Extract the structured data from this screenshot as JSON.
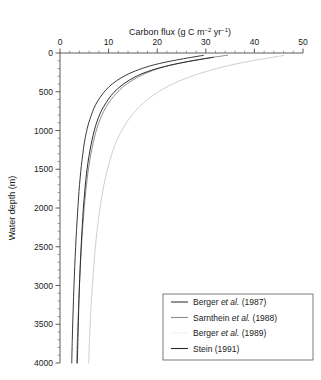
{
  "chart_data": {
    "type": "line",
    "title": "Carbon flux (g C m−2 yr−1)",
    "title_parts": {
      "prefix": "Carbon flux (g C m",
      "sup1": "−2",
      "mid": " yr",
      "sup2": "−1",
      "suffix": ")"
    },
    "xlabel": "Carbon flux (g C m-2 yr-1)",
    "ylabel": "Water depth (m)",
    "xlim": [
      0,
      50
    ],
    "ylim": [
      0,
      4000
    ],
    "y_inverted": true,
    "grid": false,
    "x_axis_position": "top",
    "xticks": [
      0,
      10,
      20,
      30,
      40,
      50
    ],
    "xtick_labels": [
      "0",
      "10",
      "20",
      "30",
      "40",
      "50"
    ],
    "x_minor_interval": 2,
    "yticks": [
      0,
      500,
      1000,
      1500,
      2000,
      2500,
      3000,
      3500,
      4000
    ],
    "ytick_labels": [
      "0",
      "500",
      "1000",
      "1500",
      "2000",
      "2500",
      "3000",
      "3500",
      "4000"
    ],
    "y_minor_interval": 100,
    "legend_position": "bottom-right",
    "series": [
      {
        "name": "Berger et al. (1987)",
        "name_prefix": "Berger ",
        "name_italic": "et al.",
        "name_suffix": " (1987)",
        "color": "#3a3a3a",
        "width": 1.0,
        "points": [
          [
            29.5,
            30
          ],
          [
            24.0,
            90
          ],
          [
            19.5,
            150
          ],
          [
            16.2,
            215
          ],
          [
            13.6,
            285
          ],
          [
            11.6,
            360
          ],
          [
            10.0,
            440
          ],
          [
            8.8,
            525
          ],
          [
            7.8,
            615
          ],
          [
            7.0,
            710
          ],
          [
            6.4,
            810
          ],
          [
            5.85,
            915
          ],
          [
            5.4,
            1030
          ],
          [
            5.0,
            1160
          ],
          [
            4.7,
            1300
          ],
          [
            4.4,
            1450
          ],
          [
            4.15,
            1610
          ],
          [
            3.9,
            1790
          ],
          [
            3.7,
            1980
          ],
          [
            3.5,
            2180
          ],
          [
            3.3,
            2400
          ],
          [
            3.12,
            2630
          ],
          [
            2.95,
            2880
          ],
          [
            2.8,
            3140
          ],
          [
            2.65,
            3420
          ],
          [
            2.52,
            3710
          ],
          [
            2.42,
            4000
          ]
        ]
      },
      {
        "name": "Sarnthein et al. (1988)",
        "name_prefix": "Sarnthein ",
        "name_italic": "et al.",
        "name_suffix": " (1988)",
        "color": "#8c8c8c",
        "width": 1.0,
        "points": [
          [
            34.5,
            28
          ],
          [
            28.5,
            85
          ],
          [
            23.5,
            145
          ],
          [
            19.8,
            210
          ],
          [
            17.0,
            280
          ],
          [
            14.8,
            355
          ],
          [
            13.0,
            435
          ],
          [
            11.6,
            520
          ],
          [
            10.4,
            610
          ],
          [
            9.4,
            705
          ],
          [
            8.6,
            805
          ],
          [
            7.9,
            915
          ],
          [
            7.3,
            1035
          ],
          [
            6.8,
            1165
          ],
          [
            6.35,
            1305
          ],
          [
            5.95,
            1455
          ],
          [
            5.6,
            1615
          ],
          [
            5.3,
            1790
          ],
          [
            5.0,
            1980
          ],
          [
            4.75,
            2185
          ],
          [
            4.5,
            2405
          ],
          [
            4.28,
            2640
          ],
          [
            4.08,
            2890
          ],
          [
            3.9,
            3155
          ],
          [
            3.72,
            3435
          ],
          [
            3.56,
            3720
          ],
          [
            3.42,
            4000
          ]
        ]
      },
      {
        "name": "Berger et al. (1989)",
        "name_prefix": "Berger ",
        "name_italic": "et al.",
        "name_suffix": " (1989)",
        "color": "#c8c8c8",
        "width": 0.9,
        "points": [
          [
            46.0,
            32
          ],
          [
            40.0,
            95
          ],
          [
            34.5,
            165
          ],
          [
            30.0,
            240
          ],
          [
            26.2,
            320
          ],
          [
            23.0,
            405
          ],
          [
            20.4,
            495
          ],
          [
            18.2,
            590
          ],
          [
            16.4,
            690
          ],
          [
            14.9,
            795
          ],
          [
            13.6,
            905
          ],
          [
            12.5,
            1025
          ],
          [
            11.5,
            1155
          ],
          [
            10.7,
            1295
          ],
          [
            10.0,
            1445
          ],
          [
            9.35,
            1605
          ],
          [
            8.8,
            1780
          ],
          [
            8.3,
            1970
          ],
          [
            7.85,
            2175
          ],
          [
            7.45,
            2395
          ],
          [
            7.1,
            2630
          ],
          [
            6.8,
            2885
          ],
          [
            6.5,
            3155
          ],
          [
            6.25,
            3440
          ],
          [
            6.05,
            3730
          ],
          [
            5.9,
            4000
          ]
        ]
      },
      {
        "name": "Stein (1991)",
        "name_prefix": "Stein (1991)",
        "name_italic": "",
        "name_suffix": "",
        "color": "#2d2d2d",
        "width": 1.0,
        "points": [
          [
            31.5,
            55
          ],
          [
            26.0,
            115
          ],
          [
            21.5,
            175
          ],
          [
            18.0,
            240
          ],
          [
            15.4,
            310
          ],
          [
            13.4,
            385
          ],
          [
            11.8,
            465
          ],
          [
            10.5,
            550
          ],
          [
            9.5,
            640
          ],
          [
            8.6,
            735
          ],
          [
            7.9,
            835
          ],
          [
            7.3,
            945
          ],
          [
            6.8,
            1065
          ],
          [
            6.35,
            1195
          ],
          [
            5.95,
            1335
          ],
          [
            5.6,
            1485
          ],
          [
            5.3,
            1645
          ],
          [
            5.05,
            1820
          ],
          [
            4.8,
            2010
          ],
          [
            4.6,
            2215
          ],
          [
            4.4,
            2435
          ],
          [
            4.22,
            2670
          ],
          [
            4.05,
            2920
          ],
          [
            3.9,
            3185
          ],
          [
            3.78,
            3465
          ],
          [
            3.66,
            3755
          ],
          [
            3.56,
            4000
          ]
        ]
      }
    ]
  }
}
